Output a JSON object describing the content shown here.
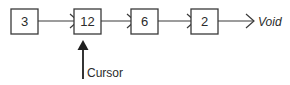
{
  "diagram": {
    "type": "linked-list",
    "nodes": [
      {
        "value": "3",
        "x": 11,
        "y": 9,
        "w": 27,
        "h": 25
      },
      {
        "value": "12",
        "x": 74,
        "y": 9,
        "w": 27,
        "h": 25
      },
      {
        "value": "6",
        "x": 131,
        "y": 9,
        "w": 27,
        "h": 25
      },
      {
        "value": "2",
        "x": 191,
        "y": 9,
        "w": 27,
        "h": 25
      }
    ],
    "connectors": [
      {
        "from": "3",
        "to": "12",
        "x1": 38,
        "x2": 77,
        "y": 21
      },
      {
        "from": "12",
        "to": "6",
        "x1": 101,
        "x2": 134,
        "y": 21
      },
      {
        "from": "6",
        "to": "2",
        "x1": 158,
        "x2": 194,
        "y": 21
      },
      {
        "from": "2",
        "to": "Void",
        "x1": 218,
        "x2": 254,
        "y": 21
      }
    ],
    "terminal": {
      "label": "Void",
      "x": 258,
      "y": 26
    },
    "cursor": {
      "label": "Cursor",
      "points_to": "12",
      "shaft_x": 83,
      "shaft_top": 43,
      "shaft_bottom": 79,
      "tip_y": 40,
      "label_x": 87,
      "label_y": 77
    },
    "colors": {
      "background": "#ffffff",
      "stroke": "#3a3a3a",
      "text": "#2b2b2b",
      "cursor": "#1f1f1f"
    }
  }
}
